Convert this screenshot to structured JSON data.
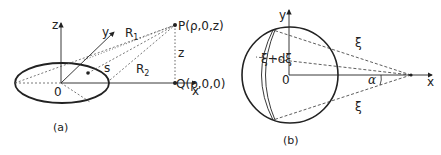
{
  "panel_a": {
    "caption": "(a)",
    "axis_z": "z",
    "axis_y": "y",
    "axis_x": "x",
    "origin": "0",
    "point_P": "P(ρ,0,z)",
    "point_Q": "Q(ρ,0,0)",
    "label_R1": "R",
    "label_R1_sub": "1",
    "label_R2": "R",
    "label_R2_sub": "2",
    "label_s": "s",
    "label_z": "z"
  },
  "panel_b": {
    "caption": "(b)",
    "axis_y": "y",
    "axis_x": "x",
    "origin": "0",
    "label_xi_top": "ξ",
    "label_xi_bottom": "ξ",
    "label_xi_dxi": "ξ+dξ",
    "label_alpha": "α"
  },
  "colors": {
    "stroke": "#222222",
    "background": "#ffffff"
  }
}
